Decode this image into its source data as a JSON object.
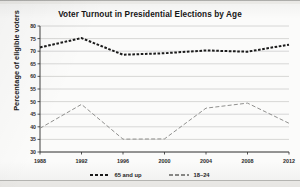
{
  "chart_data": {
    "type": "line",
    "title": "Voter Turnout in Presidential Elections by Age",
    "xlabel": "",
    "ylabel": "Percentage of eligible voters",
    "categories": [
      "1988",
      "1992",
      "1996",
      "2000",
      "2004",
      "2008",
      "2012"
    ],
    "x": [
      1988,
      1992,
      1996,
      2000,
      2004,
      2008,
      2012
    ],
    "ylim": [
      30,
      80
    ],
    "yticks": [
      30,
      35,
      40,
      45,
      50,
      55,
      60,
      65,
      70,
      75,
      80
    ],
    "xlim": [
      1988,
      2012
    ],
    "grid": "horizontal",
    "legend_position": "bottom-center",
    "series": [
      {
        "name": "65 and up",
        "values": [
          71.5,
          75.2,
          68.6,
          69.2,
          70.3,
          69.8,
          72.6
        ],
        "color": "#1b1b1b",
        "style": "dashed-thick"
      },
      {
        "name": "18–24",
        "values": [
          39.4,
          48.9,
          35.1,
          35.2,
          47.4,
          49.4,
          41.4
        ],
        "color": "#8a8a88",
        "style": "dashed-thin"
      }
    ]
  },
  "chart": {
    "title": "Voter Turnout in Presidential Elections by Age",
    "y_axis_title": "Percentage of eligible voters",
    "y_tick_labels": [
      "80",
      "75",
      "70",
      "65",
      "60",
      "55",
      "50",
      "45",
      "40",
      "35",
      "30"
    ],
    "x_tick_labels": [
      "1988",
      "1992",
      "1996",
      "2000",
      "2004",
      "2008",
      "2012"
    ],
    "legend": [
      {
        "label": "65 and up",
        "color": "#1b1b1b"
      },
      {
        "label": "18–24",
        "color": "#8a8a88"
      }
    ]
  }
}
